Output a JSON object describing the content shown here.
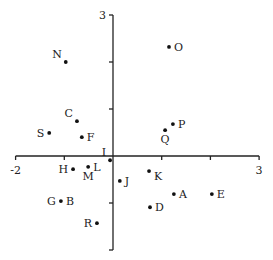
{
  "chart_data": {
    "type": "scatter",
    "title": "",
    "xlabel": "",
    "ylabel": "",
    "xlim": [
      -2,
      3
    ],
    "ylim": [
      -2,
      3
    ],
    "grid": false,
    "legend": null,
    "axes_cross_at_origin": true,
    "x_tick_labels": [
      {
        "value": -2,
        "label": "-2"
      },
      {
        "value": 3,
        "label": "3"
      }
    ],
    "y_tick_labels": [
      {
        "value": 3,
        "label": "3"
      }
    ],
    "x_ticks": [
      -2,
      -1,
      0,
      1,
      2,
      3
    ],
    "y_ticks": [
      -2,
      -1,
      0,
      1,
      2,
      3
    ],
    "points": [
      {
        "label": "A",
        "x": 1.25,
        "y": -0.81,
        "label_pos": "right"
      },
      {
        "label": "B",
        "x": -1.07,
        "y": -0.96,
        "label_pos": "right"
      },
      {
        "label": "C",
        "x": -0.74,
        "y": 0.74,
        "label_pos": "upper-left"
      },
      {
        "label": "D",
        "x": 0.76,
        "y": -1.09,
        "label_pos": "right"
      },
      {
        "label": "E",
        "x": 2.03,
        "y": -0.81,
        "label_pos": "right"
      },
      {
        "label": "F",
        "x": -0.64,
        "y": 0.4,
        "label_pos": "right"
      },
      {
        "label": "G",
        "x": -1.07,
        "y": -0.96,
        "label_pos": "left"
      },
      {
        "label": "H",
        "x": -0.82,
        "y": -0.28,
        "label_pos": "left"
      },
      {
        "label": "I",
        "x": -0.06,
        "y": -0.09,
        "label_pos": "upper-left"
      },
      {
        "label": "J",
        "x": 0.14,
        "y": -0.53,
        "label_pos": "right"
      },
      {
        "label": "K",
        "x": 0.74,
        "y": -0.32,
        "label_pos": "lower-right"
      },
      {
        "label": "L",
        "x": -0.51,
        "y": -0.23,
        "label_pos": "right"
      },
      {
        "label": "M",
        "x": -0.51,
        "y": -0.23,
        "label_pos": "below"
      },
      {
        "label": "N",
        "x": -0.97,
        "y": 2.0,
        "label_pos": "upper-left"
      },
      {
        "label": "O",
        "x": 1.15,
        "y": 2.32,
        "label_pos": "right"
      },
      {
        "label": "P",
        "x": 1.23,
        "y": 0.68,
        "label_pos": "right"
      },
      {
        "label": "Q",
        "x": 1.07,
        "y": 0.55,
        "label_pos": "below"
      },
      {
        "label": "R",
        "x": -0.33,
        "y": -1.43,
        "label_pos": "left"
      },
      {
        "label": "S",
        "x": -1.31,
        "y": 0.49,
        "label_pos": "left"
      }
    ]
  },
  "colors": {
    "background": "#ffffff",
    "axis": "#222222",
    "point": "#111111",
    "text": "#222222"
  }
}
